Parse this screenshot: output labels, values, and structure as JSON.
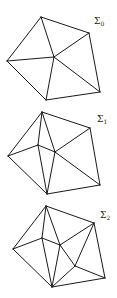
{
  "figures": [
    {
      "id": "sigma0",
      "label": "Σ",
      "subscript": "0",
      "label_pos": [
        94,
        24
      ],
      "vertices": {
        "top": [
          41,
          17
        ],
        "right": [
          89,
          33
        ],
        "left": [
          7,
          61
        ],
        "center": [
          54,
          57
        ],
        "bottom_right": [
          100,
          92
        ],
        "bottom": [
          46,
          100
        ]
      },
      "edges": [
        [
          "top",
          "right"
        ],
        [
          "top",
          "left"
        ],
        [
          "top",
          "center"
        ],
        [
          "left",
          "center"
        ],
        [
          "left",
          "bottom"
        ],
        [
          "center",
          "right"
        ],
        [
          "center",
          "bottom"
        ],
        [
          "center",
          "bottom_right"
        ],
        [
          "right",
          "bottom_right"
        ],
        [
          "bottom",
          "bottom_right"
        ]
      ]
    },
    {
      "id": "sigma1",
      "label": "Σ",
      "subscript": "1",
      "label_pos": [
        97,
        122
      ],
      "vertices": {
        "top": [
          42,
          112
        ],
        "right": [
          90,
          128
        ],
        "left": [
          8,
          156
        ],
        "inner_left": [
          38,
          145
        ],
        "center": [
          55,
          152
        ],
        "bottom_right": [
          100,
          185
        ],
        "bottom": [
          47,
          194
        ]
      },
      "edges": [
        [
          "top",
          "right"
        ],
        [
          "top",
          "left"
        ],
        [
          "top",
          "inner_left"
        ],
        [
          "top",
          "center"
        ],
        [
          "left",
          "inner_left"
        ],
        [
          "left",
          "bottom"
        ],
        [
          "inner_left",
          "center"
        ],
        [
          "inner_left",
          "bottom"
        ],
        [
          "center",
          "right"
        ],
        [
          "center",
          "bottom"
        ],
        [
          "center",
          "bottom_right"
        ],
        [
          "right",
          "bottom_right"
        ],
        [
          "bottom",
          "bottom_right"
        ]
      ]
    },
    {
      "id": "sigma2",
      "label": "Σ",
      "subscript": "2",
      "label_pos": [
        100,
        218
      ],
      "vertices": {
        "top": [
          46,
          206
        ],
        "right": [
          94,
          223
        ],
        "left": [
          13,
          249
        ],
        "inner_left": [
          42,
          238
        ],
        "center": [
          60,
          245
        ],
        "inner_bottom_right": [
          75,
          266
        ],
        "bottom_right": [
          105,
          278
        ],
        "bottom": [
          52,
          287
        ]
      },
      "edges": [
        [
          "top",
          "right"
        ],
        [
          "top",
          "left"
        ],
        [
          "top",
          "inner_left"
        ],
        [
          "top",
          "center"
        ],
        [
          "left",
          "inner_left"
        ],
        [
          "left",
          "bottom"
        ],
        [
          "inner_left",
          "center"
        ],
        [
          "inner_left",
          "bottom"
        ],
        [
          "center",
          "right"
        ],
        [
          "center",
          "bottom"
        ],
        [
          "center",
          "inner_bottom_right"
        ],
        [
          "inner_bottom_right",
          "right"
        ],
        [
          "inner_bottom_right",
          "bottom"
        ],
        [
          "inner_bottom_right",
          "bottom_right"
        ],
        [
          "right",
          "bottom_right"
        ],
        [
          "bottom",
          "bottom_right"
        ]
      ]
    }
  ]
}
